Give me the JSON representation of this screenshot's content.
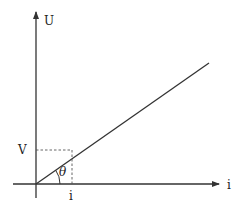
{
  "diagram": {
    "type": "voltage-current-graph",
    "axes": {
      "vertical_label": "U",
      "horizontal_label": "i"
    },
    "point": {
      "voltage_label": "V",
      "current_label": "i"
    },
    "angle_label": "θ",
    "colors": {
      "stroke": "#333333",
      "text": "#222222",
      "background": "#ffffff"
    }
  }
}
